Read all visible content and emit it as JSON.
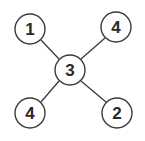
{
  "diagram": {
    "type": "tree",
    "stroke_color": "#3a3a3a",
    "fill_color": "#ffffff",
    "nodes": [
      {
        "id": "center",
        "label": "3",
        "cx": 70,
        "cy": 70,
        "r": 15
      },
      {
        "id": "top-left",
        "label": "1",
        "cx": 30,
        "cy": 29,
        "r": 15
      },
      {
        "id": "top-right",
        "label": "4",
        "cx": 116,
        "cy": 27,
        "r": 15
      },
      {
        "id": "bottom-left",
        "label": "4",
        "cx": 30,
        "cy": 113,
        "r": 15
      },
      {
        "id": "bottom-right",
        "label": "2",
        "cx": 117,
        "cy": 113,
        "r": 15
      }
    ],
    "edges": [
      {
        "from": "center",
        "to": "top-left"
      },
      {
        "from": "center",
        "to": "top-right"
      },
      {
        "from": "center",
        "to": "bottom-left"
      },
      {
        "from": "center",
        "to": "bottom-right"
      }
    ]
  }
}
